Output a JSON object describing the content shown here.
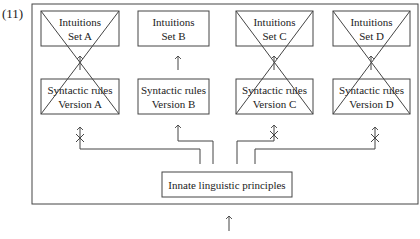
{
  "example_number": "(11)",
  "columns": [
    {
      "id": "A",
      "intuitions": {
        "line1": "Intuitions",
        "line2": "Set A"
      },
      "rules": {
        "line1": "Syntactic rules",
        "line2": "Version A"
      },
      "crossed": true
    },
    {
      "id": "B",
      "intuitions": {
        "line1": "Intuitions",
        "line2": "Set B"
      },
      "rules": {
        "line1": "Syntactic rules",
        "line2": "Version B"
      },
      "crossed": false
    },
    {
      "id": "C",
      "intuitions": {
        "line1": "Intuitions",
        "line2": "Set C"
      },
      "rules": {
        "line1": "Syntactic rules",
        "line2": "Version C"
      },
      "crossed": true
    },
    {
      "id": "D",
      "intuitions": {
        "line1": "Intuitions",
        "line2": "Set D"
      },
      "rules": {
        "line1": "Syntactic rules",
        "line2": "Version D"
      },
      "crossed": true
    }
  ],
  "innate": {
    "label": "Innate linguistic principles"
  },
  "colors": {
    "stroke": "#444444",
    "background": "#ffffff"
  }
}
